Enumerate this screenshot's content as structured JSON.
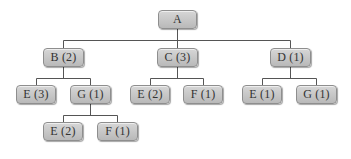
{
  "diagram": {
    "type": "tree",
    "root": {
      "id": "A",
      "label": "A",
      "children": [
        {
          "id": "B",
          "label": "B (2)",
          "children": [
            {
              "id": "B-E",
              "label": "E (3)"
            },
            {
              "id": "B-G",
              "label": "G (1)",
              "children": [
                {
                  "id": "B-G-E",
                  "label": "E (2)"
                },
                {
                  "id": "B-G-F",
                  "label": "F (1)"
                }
              ]
            }
          ]
        },
        {
          "id": "C",
          "label": "C (3)",
          "children": [
            {
              "id": "C-E",
              "label": "E (2)"
            },
            {
              "id": "C-F",
              "label": "F (1)"
            }
          ]
        },
        {
          "id": "D",
          "label": "D (1)",
          "children": [
            {
              "id": "D-E",
              "label": "E (1)"
            },
            {
              "id": "D-G",
              "label": "G (1)"
            }
          ]
        }
      ]
    },
    "nodes": {
      "a": "A",
      "b": "B (2)",
      "c": "C (3)",
      "d": "D (1)",
      "b_e": "E (3)",
      "b_g": "G (1)",
      "b_g_e": "E (2)",
      "b_g_f": "F (1)",
      "c_e": "E (2)",
      "c_f": "F (1)",
      "d_e": "E (1)",
      "d_g": "G (1)"
    },
    "colors": {
      "node_fill_top": "#d6d6d6",
      "node_fill_bottom": "#b9b9b9",
      "node_border": "#8e8e8e",
      "edge": "#555555",
      "text": "#333333"
    }
  }
}
